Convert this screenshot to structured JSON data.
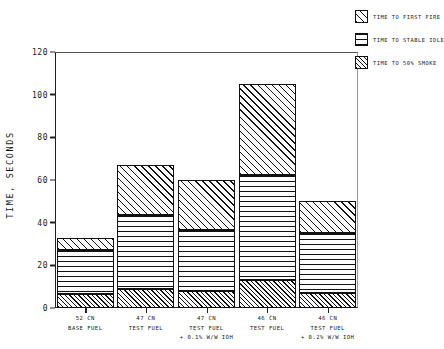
{
  "chart_data": {
    "type": "bar",
    "stacked": true,
    "title": "",
    "xlabel": "",
    "ylabel": "TIME, SECONDS",
    "ylim": [
      0,
      120
    ],
    "ytick_labels": [
      "0",
      "20",
      "40",
      "60",
      "80",
      "100",
      "120"
    ],
    "ytick_values": [
      0,
      20,
      40,
      60,
      80,
      100,
      120
    ],
    "grid": false,
    "legend_position": "top-right",
    "categories": [
      "52 CN\nBASE FUEL",
      "47 CN\nTEST FUEL",
      "47 CN\nTEST FUEL\n+ 0.1% W/W IOH",
      "46 CN\nTEST FUEL",
      "46 CN\nTEST FUEL\n+ 0.2% W/W IOH"
    ],
    "category_lines": [
      [
        "52 CN",
        "BASE FUEL"
      ],
      [
        "47 CN",
        "TEST FUEL"
      ],
      [
        "47 CN",
        "TEST FUEL",
        "+ 0.1% W/W IOH"
      ],
      [
        "46 CN",
        "TEST FUEL"
      ],
      [
        "46 CN",
        "TEST FUEL",
        "+ 0.2% W/W IOH"
      ]
    ],
    "series": [
      {
        "name": "TIME TO 50% SMOKE",
        "pattern": "diagonal-fine",
        "values": [
          6.5,
          9,
          8,
          13,
          7
        ]
      },
      {
        "name": "TIME TO STABLE IDLE",
        "pattern": "horizontal",
        "values": [
          20.5,
          34.5,
          28.5,
          49.5,
          28
        ]
      },
      {
        "name": "TIME TO FIRST FIRE",
        "pattern": "diagonal",
        "values": [
          6,
          23.5,
          23.5,
          42.5,
          15
        ]
      }
    ],
    "cumulative_tops": [
      [
        6.5,
        27,
        33
      ],
      [
        9,
        43.5,
        67
      ],
      [
        8,
        36.5,
        60
      ],
      [
        13,
        62.5,
        105
      ],
      [
        7,
        35,
        50
      ]
    ],
    "totals": [
      33,
      67,
      60,
      105,
      50
    ]
  },
  "legend": {
    "items": [
      {
        "label": "TIME TO FIRST FIRE",
        "pattern": "diagonal"
      },
      {
        "label": "TIME TO STABLE IDLE",
        "pattern": "horizontal"
      },
      {
        "label": "TIME TO 50% SMOKE",
        "pattern": "diagonal-fine"
      }
    ]
  },
  "colors": {
    "axis": "#222222",
    "hatch": "#111111",
    "background": "#ffffff"
  }
}
